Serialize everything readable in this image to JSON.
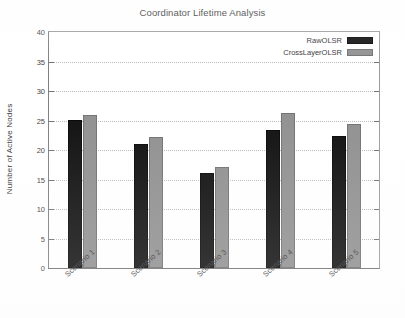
{
  "chart_data": {
    "type": "bar",
    "title": "Coordinator Lifetime Analysis",
    "xlabel": "",
    "ylabel": "Number of Active Nodes",
    "categories": [
      "Scenario 1",
      "Scenario 2",
      "Scenario 3",
      "Scenario 4",
      "Scenario 5"
    ],
    "series": [
      {
        "name": "RawOLSR",
        "color": "#0b0b0b",
        "values": [
          25.1,
          21.0,
          16.1,
          23.4,
          22.4
        ]
      },
      {
        "name": "CrossLayerOLSR",
        "color": "#8e8e8e",
        "values": [
          26.0,
          22.2,
          17.1,
          26.3,
          24.4
        ]
      }
    ],
    "ylim": [
      0,
      40
    ],
    "ytick_labels": [
      "0",
      "5",
      "10",
      "15",
      "20",
      "25",
      "30",
      "35",
      "40"
    ],
    "ytick_values": [
      0,
      5,
      10,
      15,
      20,
      25,
      30,
      35,
      40
    ],
    "grid": true,
    "grid_style": "dotted-horizontal",
    "legend_position": "top-right",
    "xtick_label_rotation": -42
  },
  "figure": {
    "background_color": "#ffffff",
    "axis_color": "#6f6f6f",
    "grid_color": "#b9b9b9",
    "text_color": "#333333"
  }
}
